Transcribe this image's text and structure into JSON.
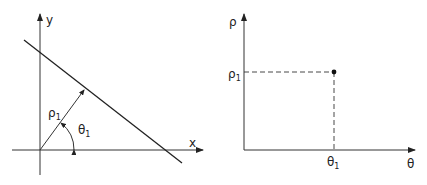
{
  "left_diagram": {
    "title": "Cartesian line representation",
    "x_axis_label": "x",
    "y_axis_label": "y",
    "rho_label": "ρ",
    "rho_sub": "1",
    "theta_label": "θ",
    "theta_sub": "1"
  },
  "right_diagram": {
    "title": "Hough parameter space",
    "vertical_axis_label": "ρ",
    "horizontal_axis_label": "θ",
    "rho_tick_label": "ρ",
    "rho_tick_sub": "1",
    "theta_tick_label": "θ",
    "theta_tick_sub": "1"
  },
  "colors": {
    "stroke": "#222222",
    "background": "#ffffff"
  }
}
